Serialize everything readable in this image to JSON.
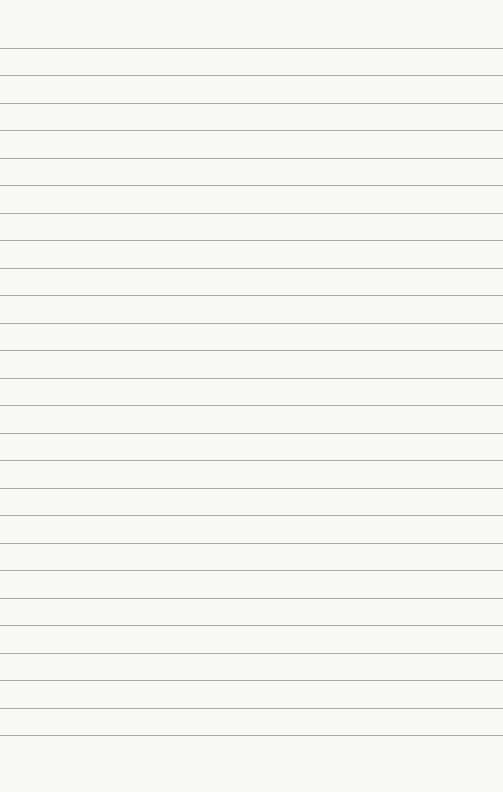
{
  "paper": {
    "type": "ruled-paper",
    "background_color": "#f8f8f7",
    "line_color": "#a9a9a9",
    "first_line_y": 48,
    "line_spacing": 27.48,
    "line_count": 26,
    "text_content": ""
  }
}
